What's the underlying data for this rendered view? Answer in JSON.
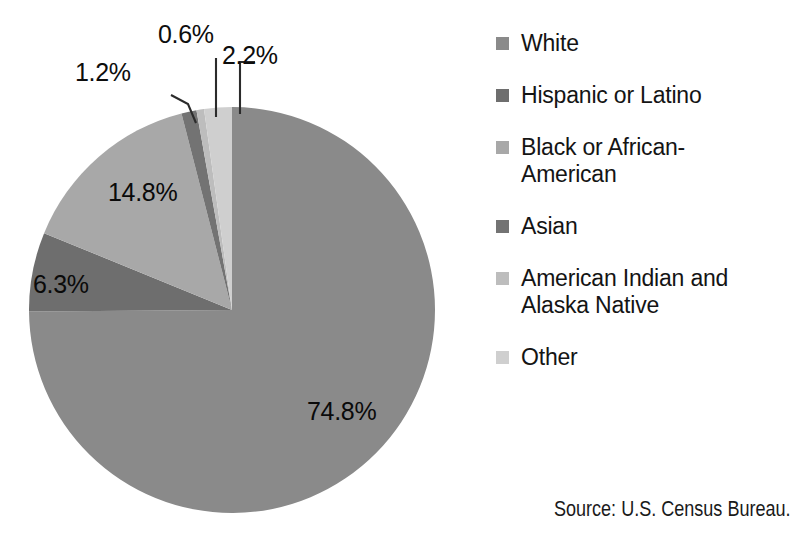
{
  "chart_data": {
    "type": "pie",
    "title": "",
    "categories": [
      "White",
      "Hispanic or Latino",
      "Black or African-American",
      "Asian",
      "American Indian and Alaska Native",
      "Other"
    ],
    "values": [
      74.8,
      6.3,
      14.8,
      1.2,
      0.6,
      2.2
    ],
    "value_labels": [
      "74.8%",
      "6.3%",
      "14.8%",
      "1.2%",
      "0.6%",
      "2.2%"
    ],
    "colors": [
      "#8a8a8a",
      "#6e6e6e",
      "#a8a8a8",
      "#737373",
      "#bdbdbd",
      "#cfcfcf"
    ],
    "unit": "percent",
    "legend_position": "right",
    "grid": false,
    "start_angle_deg": 0,
    "direction": "clockwise",
    "label_placement": [
      "inside",
      "inside",
      "inside",
      "outside",
      "outside",
      "outside"
    ],
    "source": "Source: U.S. Census Bureau."
  },
  "labels": {
    "white_pct": "74.8%",
    "hispanic_pct": "6.3%",
    "black_pct": "14.8%",
    "asian_pct": "1.2%",
    "american_indian_pct": "0.6%",
    "other_pct": "2.2%"
  },
  "legend": {
    "items": [
      {
        "label": "White",
        "color": "#8a8a8a"
      },
      {
        "label": "Hispanic or Latino",
        "color": "#6e6e6e"
      },
      {
        "label": "Black or African-American",
        "color": "#a8a8a8"
      },
      {
        "label": "Asian",
        "color": "#737373"
      },
      {
        "label": "American Indian and Alaska Native",
        "color": "#bdbdbd"
      },
      {
        "label": "Other",
        "color": "#cfcfcf"
      }
    ]
  },
  "footer": {
    "source": "Source: U.S. Census Bureau."
  },
  "title_strip": {
    "text": ""
  }
}
